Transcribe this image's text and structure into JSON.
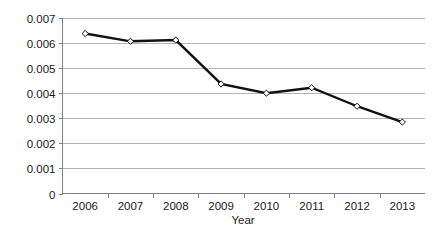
{
  "chart_data": {
    "type": "line",
    "title": "",
    "subtitle": "",
    "xlabel": "Year",
    "ylabel": "",
    "categories": [
      "2006",
      "2007",
      "2008",
      "2009",
      "2010",
      "2011",
      "2012",
      "2013"
    ],
    "values": [
      0.00638,
      0.00607,
      0.00612,
      0.00437,
      0.004,
      0.00422,
      0.00348,
      0.00285
    ],
    "series": [
      {
        "name": "rate",
        "values": [
          0.00638,
          0.00607,
          0.00612,
          0.00437,
          0.004,
          0.00422,
          0.00348,
          0.00285
        ]
      }
    ],
    "ylim": [
      0,
      0.007
    ],
    "yticks": [
      0,
      0.001,
      0.002,
      0.003,
      0.004,
      0.005,
      0.006,
      0.007
    ],
    "ytick_labels": [
      "0",
      "0.001",
      "0.002",
      "0.003",
      "0.004",
      "0.005",
      "0.006",
      "0.007"
    ],
    "xtick_labels": [
      "2006",
      "2007",
      "2008",
      "2009",
      "2010",
      "2011",
      "2012",
      "2013"
    ],
    "grid": "horizontal",
    "legend": "none",
    "marker": "open-diamond",
    "line_color": "#111111",
    "grid_color": "#b4b4b4",
    "axis_color": "#808080",
    "marker_fill": "#ffffff",
    "background": "#ffffff",
    "annotations": []
  }
}
